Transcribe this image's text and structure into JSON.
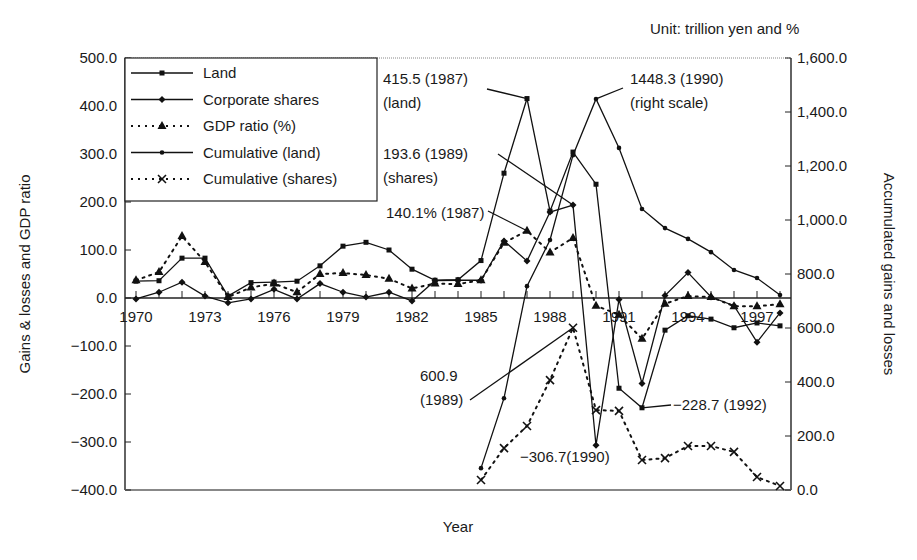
{
  "chart_data": {
    "type": "line",
    "title": "",
    "unit_note": "Unit: trillion yen and %",
    "xlabel": "Year",
    "ylabel": "Gains & losses and GDP ratio",
    "ylabel_right": "Accumulated gains and losses",
    "x": [
      1970,
      1971,
      1972,
      1973,
      1974,
      1975,
      1976,
      1977,
      1978,
      1979,
      1980,
      1981,
      1982,
      1983,
      1984,
      1985,
      1986,
      1987,
      1988,
      1989,
      1990,
      1991,
      1992,
      1993,
      1994,
      1995,
      1996,
      1997,
      1998
    ],
    "x_tick_labels": [
      "1970",
      "1973",
      "1976",
      "1979",
      "1982",
      "1985",
      "1988",
      "1991",
      "1994",
      "1997"
    ],
    "ylim": [
      -400,
      500
    ],
    "ylim_right": [
      0,
      1600
    ],
    "y_ticks": [
      "500.0",
      "400.0",
      "300.0",
      "200.0",
      "100.0",
      "0.0",
      "-100.0",
      "-200.0",
      "-300.0",
      "-400.0"
    ],
    "y_ticks_right": [
      "1,600.0",
      "1,400.0",
      "1,200.0",
      "1,000.0",
      "800.0",
      "600.0",
      "400.0",
      "200.0",
      "0.0"
    ],
    "grid": false,
    "legend_position": "upper left",
    "series": [
      {
        "name": "Land",
        "axis": "left",
        "style": "solid",
        "marker": "square",
        "x": [
          1970,
          1971,
          1972,
          1973,
          1974,
          1975,
          1976,
          1977,
          1978,
          1979,
          1980,
          1981,
          1982,
          1983,
          1984,
          1985,
          1986,
          1987,
          1988,
          1989,
          1990,
          1991,
          1992,
          1993,
          1994,
          1995,
          1996,
          1997,
          1998
        ],
        "values": [
          35,
          36,
          83,
          83,
          4,
          32,
          33,
          35,
          67,
          108,
          116,
          100,
          60,
          37,
          38,
          78,
          260,
          415.5,
          181,
          304,
          237,
          -188,
          -228.7,
          -67,
          -37,
          -44,
          -62,
          -52,
          -58
        ]
      },
      {
        "name": "Corporate shares",
        "axis": "left",
        "style": "solid",
        "marker": "diamond",
        "x": [
          1970,
          1971,
          1972,
          1973,
          1974,
          1975,
          1976,
          1977,
          1978,
          1979,
          1980,
          1981,
          1982,
          1983,
          1984,
          1985,
          1986,
          1987,
          1988,
          1989,
          1990,
          1991,
          1992,
          1993,
          1994,
          1995,
          1996,
          1997,
          1998
        ],
        "values": [
          -2,
          12,
          33,
          4,
          -10,
          -2,
          18,
          -2,
          30,
          12,
          2,
          12,
          -6,
          36,
          37,
          37,
          119,
          77,
          179,
          193.6,
          -306.7,
          -3,
          -178,
          5,
          53,
          2,
          -16,
          -92,
          -31
        ]
      },
      {
        "name": "GDP ratio (%)",
        "axis": "left",
        "style": "dotted",
        "marker": "triangle",
        "x": [
          1970,
          1971,
          1972,
          1973,
          1974,
          1975,
          1976,
          1977,
          1978,
          1979,
          1980,
          1981,
          1982,
          1983,
          1984,
          1985,
          1986,
          1987,
          1988,
          1989,
          1990,
          1991,
          1992,
          1993,
          1994,
          1995,
          1996,
          1997,
          1998
        ],
        "values": [
          37,
          54,
          129,
          75,
          2,
          22,
          30,
          12,
          50,
          52,
          48,
          40,
          20,
          30,
          29,
          37,
          115,
          140.1,
          95,
          125,
          -16,
          -35,
          -85,
          -12,
          4,
          2,
          -17,
          -17,
          -13
        ]
      },
      {
        "name": "Cumulative (land)",
        "axis": "right",
        "style": "solid",
        "marker": "dot",
        "x": [
          1985,
          1986,
          1987,
          1988,
          1989,
          1990,
          1991,
          1992,
          1993,
          1994,
          1995,
          1996,
          1997,
          1998
        ],
        "values": [
          81,
          340,
          755,
          926,
          1240,
          1448.3,
          1267,
          1041,
          970,
          930,
          881,
          815,
          785,
          722
        ]
      },
      {
        "name": "Cumulative (shares)",
        "axis": "right",
        "style": "dotted",
        "marker": "x",
        "x": [
          1985,
          1986,
          1987,
          1988,
          1989,
          1990,
          1991,
          1992,
          1993,
          1994,
          1995,
          1996,
          1997,
          1998
        ],
        "values": [
          37,
          155,
          237,
          407,
          600.9,
          296,
          293,
          111,
          118,
          163,
          163,
          141,
          48,
          15
        ]
      }
    ],
    "annotations": [
      {
        "lines": [
          "415.5 (1987)",
          "(land)"
        ],
        "text_x": 383,
        "text_y": 84,
        "target_year": 1987,
        "target_value": 415.5,
        "axis": "left",
        "leader_from": [
          487,
          89
        ]
      },
      {
        "lines": [
          "1448.3 (1990)",
          "(right scale)"
        ],
        "text_x": 630,
        "text_y": 84,
        "target_year": 1990,
        "target_value": 1448.3,
        "axis": "right",
        "leader_from": [
          623,
          88
        ]
      },
      {
        "lines": [
          "193.6 (1989)",
          "(shares)"
        ],
        "text_x": 383,
        "text_y": 159,
        "target_year": 1989,
        "target_value": 193.6,
        "axis": "left",
        "leader_from": [
          498,
          154
        ]
      },
      {
        "lines": [
          "140.1% (1987)"
        ],
        "text_x": 386,
        "text_y": 218,
        "target_year": 1987,
        "target_value": 140.1,
        "axis": "left",
        "leader_from": [
          488,
          211
        ]
      },
      {
        "lines": [
          "600.9",
          "(1989)"
        ],
        "text_x": 420,
        "text_y": 381,
        "target_year": 1989,
        "target_value": 600.9,
        "axis": "right",
        "leader_from": [
          470,
          400
        ]
      },
      {
        "lines": [
          "−306.7(1990)"
        ],
        "text_x": 520,
        "text_y": 462,
        "target_year": null,
        "target_value": null,
        "axis": "left",
        "leader_from": null
      },
      {
        "lines": [
          "−228.7 (1992)"
        ],
        "text_x": 673,
        "text_y": 410,
        "target_year": 1992,
        "target_value": -228.7,
        "axis": "left",
        "leader_from": [
          671,
          405
        ]
      }
    ]
  }
}
